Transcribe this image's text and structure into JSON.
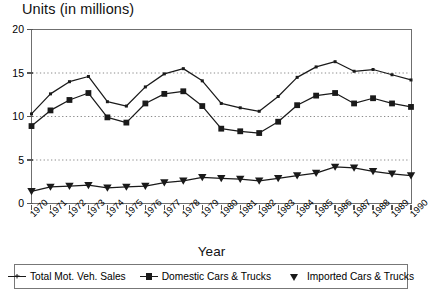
{
  "chart_data": {
    "type": "line",
    "title": "Units (in millions)",
    "xlabel": "Year",
    "ylabel": "Units (in millions)",
    "ylim": [
      0,
      20
    ],
    "yticks": [
      0,
      5,
      10,
      15,
      20
    ],
    "grid": "horizontal-dotted",
    "legend_position": "bottom",
    "categories": [
      "1970",
      "1971",
      "1972",
      "1973",
      "1974",
      "1975",
      "1976",
      "1977",
      "1978",
      "1979",
      "1980",
      "1981",
      "1982",
      "1983",
      "1984",
      "1985",
      "1986",
      "1987",
      "1988",
      "1989",
      "1990"
    ],
    "series": [
      {
        "name": "Total Mot. Veh. Sales",
        "marker": "plus",
        "color": "#1a1a1a",
        "values": [
          10.3,
          12.6,
          14.0,
          14.6,
          11.7,
          11.2,
          13.4,
          14.9,
          15.5,
          14.1,
          11.5,
          11.0,
          10.6,
          12.3,
          14.5,
          15.7,
          16.3,
          15.2,
          15.4,
          14.8,
          14.2
        ]
      },
      {
        "name": "Domestic Cars & Trucks",
        "marker": "square",
        "color": "#1a1a1a",
        "values": [
          8.9,
          10.7,
          11.9,
          12.7,
          9.9,
          9.3,
          11.5,
          12.6,
          12.9,
          11.2,
          8.6,
          8.3,
          8.1,
          9.4,
          11.3,
          12.4,
          12.7,
          11.5,
          12.1,
          11.5,
          11.1
        ]
      },
      {
        "name": "Imported Cars & Trucks",
        "marker": "triangle-down",
        "color": "#1a1a1a",
        "values": [
          1.4,
          1.9,
          2.0,
          2.1,
          1.8,
          1.9,
          2.0,
          2.4,
          2.6,
          3.0,
          2.9,
          2.8,
          2.6,
          2.9,
          3.2,
          3.5,
          4.2,
          4.1,
          3.7,
          3.4,
          3.2
        ]
      }
    ]
  },
  "axes": {
    "x_title": "Year"
  }
}
